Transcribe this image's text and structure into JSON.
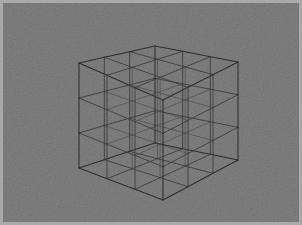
{
  "figure": {
    "subdivisions": 3,
    "projection": "oblique-perspective",
    "background_color": "#858585",
    "frame_color": "#a9a9a9",
    "line_color": "#3a3a3a",
    "width": 302,
    "height": 225,
    "caption": ""
  },
  "geometry": {
    "comment": "screen coords of the 8 outer cube corners",
    "corners": {
      "top_back": [
        155,
        46
      ],
      "top_left": [
        79,
        63
      ],
      "top_right": [
        238,
        62
      ],
      "top_front": [
        163,
        100
      ],
      "bottom_back": [
        155,
        143
      ],
      "bottom_left": [
        79,
        168
      ],
      "bottom_right": [
        238,
        160
      ],
      "bottom_front": [
        163,
        200
      ]
    },
    "axes": {
      "u_label": "u",
      "v_label": "v",
      "w_label": "w"
    }
  },
  "chart_data": {
    "type": "line",
    "xlabel": "",
    "ylabel": "",
    "grid": true,
    "legend": "none",
    "subdivisions": 3,
    "vertices_per_edge": 4,
    "total_lattice_nodes": 64,
    "total_lattice_edges": 144,
    "annotations": []
  }
}
